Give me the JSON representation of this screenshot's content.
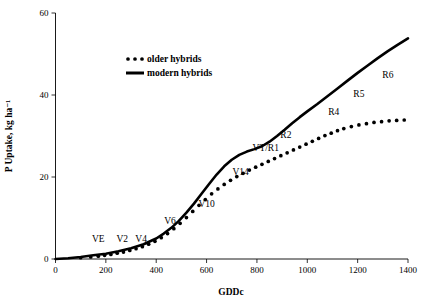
{
  "chart_data": {
    "type": "line",
    "title": "",
    "xlabel": "GDDc",
    "ylabel": "P Uptake, kg ha⁻¹",
    "xlim": [
      0,
      1400
    ],
    "ylim": [
      0,
      60
    ],
    "xticks": [
      0,
      200,
      400,
      600,
      800,
      1000,
      1200,
      1400
    ],
    "yticks": [
      0,
      20,
      40,
      60
    ],
    "grid": false,
    "legend_position": "upper-left-inside",
    "series": [
      {
        "name": "older hybrids",
        "style": "dotted",
        "marker": "circle",
        "x": [
          100,
          140,
          170,
          195,
          220,
          245,
          270,
          295,
          320,
          345,
          370,
          395,
          420,
          445,
          470,
          495,
          520,
          545,
          570,
          595,
          620,
          645,
          670,
          695,
          720,
          745,
          770,
          795,
          820,
          845,
          870,
          895,
          920,
          945,
          970,
          995,
          1020,
          1045,
          1070,
          1095,
          1120,
          1145,
          1175,
          1205,
          1235,
          1265,
          1295,
          1325,
          1355,
          1385
        ],
        "y": [
          0.3,
          0.5,
          0.7,
          0.9,
          1.1,
          1.4,
          1.7,
          2.1,
          2.5,
          3.0,
          3.6,
          4.3,
          5.2,
          6.2,
          7.4,
          8.7,
          10.1,
          11.6,
          13.1,
          14.5,
          15.9,
          17.1,
          18.2,
          19.2,
          20.1,
          20.9,
          21.7,
          22.4,
          23.1,
          23.8,
          24.5,
          25.2,
          25.9,
          26.6,
          27.3,
          28.0,
          28.7,
          29.4,
          30.1,
          30.7,
          31.3,
          31.8,
          32.3,
          32.7,
          33.0,
          33.3,
          33.5,
          33.7,
          33.8,
          33.9
        ]
      },
      {
        "name": "modern hybrids",
        "style": "solid",
        "marker": "none",
        "x": [
          0,
          50,
          100,
          150,
          200,
          250,
          300,
          350,
          400,
          430,
          460,
          490,
          520,
          550,
          580,
          610,
          640,
          670,
          700,
          730,
          760,
          790,
          820,
          850,
          880,
          910,
          940,
          970,
          1000,
          1040,
          1080,
          1120,
          1160,
          1200,
          1240,
          1280,
          1320,
          1360,
          1400
        ],
        "y": [
          0.0,
          0.2,
          0.5,
          0.9,
          1.3,
          1.9,
          2.6,
          3.6,
          5.0,
          6.2,
          7.6,
          9.3,
          11.3,
          13.5,
          15.9,
          18.3,
          20.6,
          22.6,
          24.2,
          25.4,
          26.2,
          26.8,
          27.5,
          28.6,
          30.0,
          31.5,
          33.1,
          34.6,
          36.0,
          37.8,
          39.7,
          41.6,
          43.5,
          45.4,
          47.2,
          49.0,
          50.7,
          52.3,
          53.8
        ]
      }
    ],
    "annotations": [
      {
        "label": "VE",
        "x": 170,
        "y": 4.2
      },
      {
        "label": "V2",
        "x": 265,
        "y": 4.2
      },
      {
        "label": "V4",
        "x": 340,
        "y": 4.2
      },
      {
        "label": "V6",
        "x": 455,
        "y": 8.6
      },
      {
        "label": "V10",
        "x": 600,
        "y": 12.6
      },
      {
        "label": "V14",
        "x": 735,
        "y": 20.5
      },
      {
        "label": "VT/R1",
        "x": 835,
        "y": 26.4
      },
      {
        "label": "R2",
        "x": 915,
        "y": 29.6
      },
      {
        "label": "R4",
        "x": 1105,
        "y": 35.2
      },
      {
        "label": "R5",
        "x": 1205,
        "y": 39.4
      },
      {
        "label": "R6",
        "x": 1320,
        "y": 44.2
      }
    ],
    "legend": [
      {
        "label": "older hybrids",
        "style": "dotted"
      },
      {
        "label": "modern hybrids",
        "style": "solid"
      }
    ],
    "colors": {
      "series": "#000000",
      "axis": "#000000",
      "background": "#ffffff"
    }
  }
}
